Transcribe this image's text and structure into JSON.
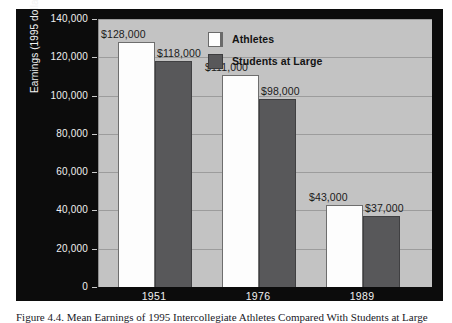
{
  "figure": {
    "caption": "Figure 4.4. Mean Earnings of 1995 Intercollegiate Athletes Compared With Students at Large"
  },
  "chart_data": {
    "type": "bar",
    "title": "",
    "xlabel": "",
    "ylabel": "Earnings (1995 dollars)",
    "categories": [
      "1951",
      "1976",
      "1989"
    ],
    "series": [
      {
        "name": "Athletes",
        "color": "#fdfdfd",
        "values": [
          128000,
          111000,
          43000
        ],
        "labels": [
          "$128,000",
          "$111,000",
          "$43,000"
        ]
      },
      {
        "name": "Students at Large",
        "color": "#58585a",
        "values": [
          118000,
          98000,
          37000
        ],
        "labels": [
          "$118,000",
          "$98,000",
          "$37,000"
        ]
      }
    ],
    "ylim": [
      0,
      140000
    ],
    "yticks": [
      0,
      20000,
      40000,
      60000,
      80000,
      100000,
      120000,
      140000
    ],
    "ytick_labels": [
      "0",
      "20,000",
      "40,000",
      "60,000",
      "80,000",
      "100,000",
      "120,000",
      "140,000"
    ],
    "grid": true,
    "legend_position": "top-right",
    "plot_background": "#c3c3c3",
    "panel_background": "#0c0c0c",
    "axis_text_color": "#f2f2f2",
    "label_text_color": "#1b1b1b"
  }
}
